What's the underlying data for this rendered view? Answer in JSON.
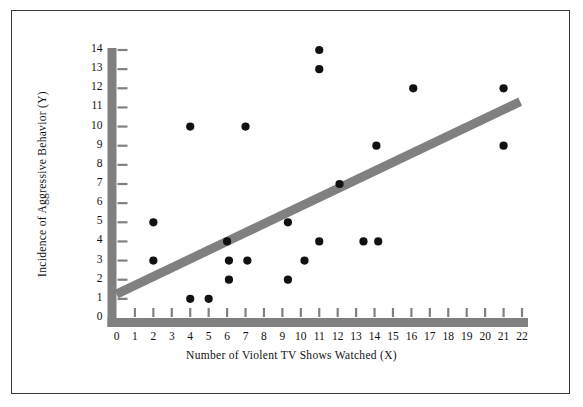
{
  "figure": {
    "border_color": "#3a3a3a",
    "background": "#ffffff"
  },
  "chart_data": {
    "type": "scatter",
    "title": "",
    "xlabel": "Number of Violent TV Shows Watched (X)",
    "ylabel": "Incidence of Aggressive Behavior (Y)",
    "xlim": [
      0,
      22
    ],
    "ylim": [
      0,
      14
    ],
    "xticks": [
      0,
      1,
      2,
      3,
      4,
      5,
      6,
      7,
      8,
      9,
      10,
      11,
      12,
      13,
      14,
      15,
      16,
      17,
      18,
      19,
      20,
      21,
      22
    ],
    "yticks": [
      0,
      1,
      2,
      3,
      4,
      5,
      6,
      7,
      8,
      9,
      10,
      11,
      12,
      13,
      14
    ],
    "xtick_labels": [
      "0",
      "1",
      "2",
      "3",
      "4",
      "5",
      "6",
      "7",
      "8",
      "9",
      "10",
      "11",
      "12",
      "13",
      "14",
      "15",
      "16",
      "17",
      "18",
      "19",
      "20",
      "21",
      "22"
    ],
    "ytick_labels": [
      "0",
      "1",
      "2",
      "3",
      "4",
      "5",
      "6",
      "7",
      "8",
      "9",
      "10",
      "11",
      "12",
      "13",
      "14"
    ],
    "grid": false,
    "legend": false,
    "marker_color": "#111111",
    "marker_size": 5,
    "axis_color": "#808080",
    "points": [
      [
        2.0,
        5.0
      ],
      [
        2.0,
        3.0
      ],
      [
        4.0,
        10.0
      ],
      [
        4.0,
        1.0
      ],
      [
        5.0,
        1.0
      ],
      [
        6.0,
        4.0
      ],
      [
        6.1,
        3.0
      ],
      [
        6.1,
        2.0
      ],
      [
        7.0,
        10.0
      ],
      [
        7.1,
        3.0
      ],
      [
        9.3,
        5.0
      ],
      [
        9.3,
        2.0
      ],
      [
        10.2,
        3.0
      ],
      [
        11.0,
        14.0
      ],
      [
        11.0,
        13.0
      ],
      [
        11.0,
        4.0
      ],
      [
        12.1,
        7.0
      ],
      [
        13.4,
        4.0
      ],
      [
        14.2,
        4.0
      ],
      [
        14.1,
        9.0
      ],
      [
        16.1,
        12.0
      ],
      [
        21.0,
        12.0
      ],
      [
        21.0,
        9.0
      ]
    ],
    "trendline": {
      "color": "#808080",
      "width": 9,
      "x0": 0.0,
      "y0": 1.25,
      "x1": 21.9,
      "y1": 11.3
    }
  }
}
